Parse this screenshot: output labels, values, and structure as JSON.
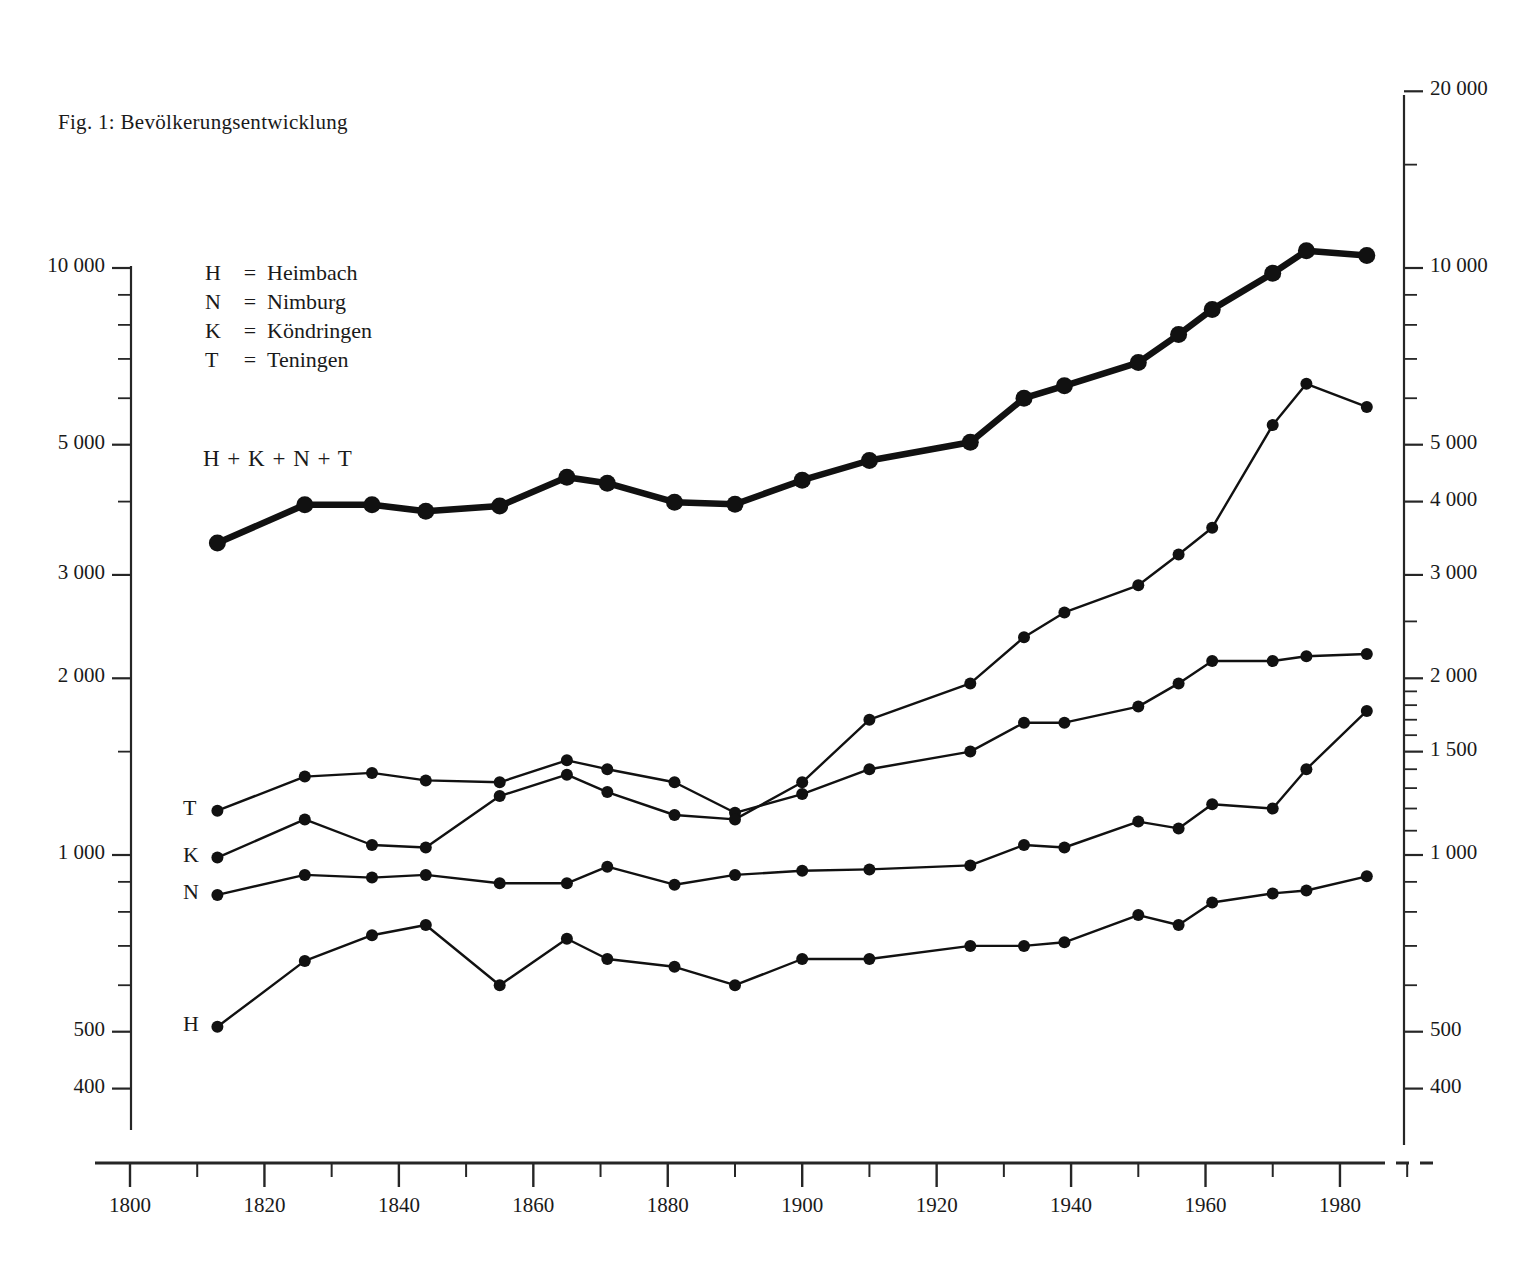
{
  "figure": {
    "title": "Fig. 1: Bevölkerungsentwicklung",
    "sum_label": "H + K + N + T"
  },
  "legend": {
    "entries": [
      {
        "key": "H",
        "eq": "=",
        "name": "Heimbach"
      },
      {
        "key": "N",
        "eq": "=",
        "name": "Nimburg"
      },
      {
        "key": "K",
        "eq": "=",
        "name": "Köndringen"
      },
      {
        "key": "T",
        "eq": "=",
        "name": "Teningen"
      }
    ]
  },
  "series_tags": [
    {
      "label": "T"
    },
    {
      "label": "K"
    },
    {
      "label": "N"
    },
    {
      "label": "H"
    }
  ],
  "axes": {
    "left_ticks": [
      "10 000",
      "5 000",
      "3 000",
      "2 000",
      "1 000",
      "500",
      "400"
    ],
    "right_ticks": [
      "20 000",
      "10 000",
      "5 000",
      "4 000",
      "3 000",
      "2 000",
      "1 500",
      "1 000",
      "500",
      "400"
    ],
    "x_ticks": [
      "1800",
      "1820",
      "1840",
      "1860",
      "1880",
      "1900",
      "1920",
      "1940",
      "1960",
      "1980"
    ]
  },
  "chart_data": {
    "type": "line",
    "title": "Fig. 1: Bevölkerungsentwicklung",
    "xlabel": "",
    "ylabel": "",
    "yscale": "log",
    "ylim": [
      370,
      20000
    ],
    "xlim": [
      1795,
      1990
    ],
    "grid": false,
    "legend_position": "upper-left inside plot",
    "x": [
      1813,
      1826,
      1836,
      1844,
      1855,
      1865,
      1871,
      1881,
      1890,
      1900,
      1910,
      1925,
      1933,
      1939,
      1950,
      1956,
      1961,
      1970,
      1975,
      1984
    ],
    "series": [
      {
        "name": "H + K + N + T",
        "label": "H + K + N + T",
        "style": "thick",
        "values": [
          3400,
          3950,
          3950,
          3850,
          3930,
          4400,
          4300,
          3990,
          3960,
          4350,
          4700,
          5050,
          6000,
          6300,
          6900,
          7700,
          8500,
          9800,
          10700,
          10500
        ]
      },
      {
        "name": "T",
        "label": "T",
        "style": "thin",
        "values": [
          1190,
          1360,
          1380,
          1340,
          1330,
          1450,
          1400,
          1330,
          1180,
          1270,
          1400,
          1500,
          1680,
          1680,
          1790,
          1960,
          2140,
          2140,
          2180,
          2200
        ]
      },
      {
        "name": "K",
        "label": "K",
        "style": "thin",
        "values": [
          990,
          1150,
          1040,
          1030,
          1260,
          1370,
          1280,
          1170,
          1150,
          1330,
          1700,
          1960,
          2350,
          2590,
          2880,
          3250,
          3610,
          5400,
          6350,
          5800
        ]
      },
      {
        "name": "N",
        "label": "N",
        "style": "thin",
        "values": [
          855,
          925,
          915,
          925,
          895,
          895,
          955,
          890,
          925,
          940,
          945,
          960,
          1040,
          1030,
          1140,
          1110,
          1220,
          1200,
          1400,
          1760
        ]
      },
      {
        "name": "H",
        "label": "H",
        "style": "thin",
        "values": [
          510,
          660,
          730,
          760,
          600,
          720,
          665,
          645,
          600,
          665,
          665,
          700,
          700,
          710,
          790,
          760,
          830,
          860,
          870,
          920
        ]
      }
    ]
  }
}
